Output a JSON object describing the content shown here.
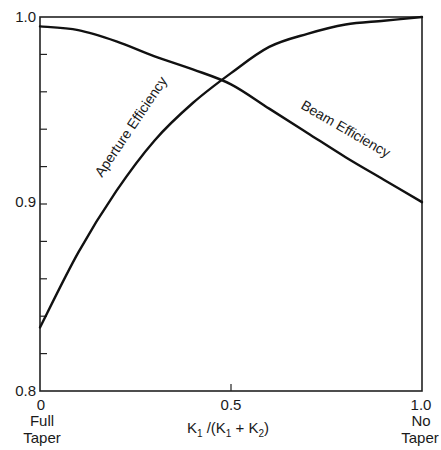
{
  "chart_data": {
    "type": "line",
    "title": "",
    "xlabel": "K1 /(K1 + K2)",
    "ylabel": "",
    "xlim": [
      0,
      1.0
    ],
    "ylim": [
      0.8,
      1.0
    ],
    "grid": false,
    "legend": "inline curve labels",
    "x_ticks": [
      {
        "value": 0,
        "label": "0",
        "sublabel": [
          "Full",
          "Taper"
        ]
      },
      {
        "value": 0.5,
        "label": "0.5",
        "sublabel": []
      },
      {
        "value": 1.0,
        "label": "1.0",
        "sublabel": [
          "No",
          "Taper"
        ]
      }
    ],
    "y_ticks_labeled": [
      {
        "value": 1.0,
        "label": "1.0"
      },
      {
        "value": 0.9,
        "label": "0.9"
      },
      {
        "value": 0.8,
        "label": "0.8"
      }
    ],
    "y_minor_tick_step": 0.02,
    "x": [
      0.0,
      0.1,
      0.2,
      0.3,
      0.4,
      0.5,
      0.6,
      0.7,
      0.8,
      0.9,
      1.0
    ],
    "series": [
      {
        "name": "Aperture Efficiency",
        "values": [
          0.834,
          0.874,
          0.907,
          0.934,
          0.954,
          0.97,
          0.984,
          0.991,
          0.996,
          0.998,
          1.0
        ]
      },
      {
        "name": "Beam Efficiency",
        "values": [
          0.995,
          0.993,
          0.987,
          0.979,
          0.972,
          0.964,
          0.951,
          0.938,
          0.925,
          0.913,
          0.901
        ]
      }
    ],
    "annotations": [
      {
        "text": "Aperture Efficiency",
        "along_series": "Aperture Efficiency"
      },
      {
        "text": "Beam Efficiency",
        "along_series": "Beam Efficiency"
      }
    ]
  },
  "labels": {
    "y_1_0": "1.0",
    "y_0_9": "0.9",
    "y_0_8": "0.8",
    "x_0": "0",
    "x_0_5": "0.5",
    "x_1_0": "1.0",
    "x_0_sub1": "Full",
    "x_0_sub2": "Taper",
    "x_1_sub1": "No",
    "x_1_sub2": "Taper",
    "x_axis_K1": "K",
    "x_axis_rest1": " /(K",
    "x_axis_rest2": " + K",
    "x_axis_close": ")",
    "sub1": "1",
    "sub2": "2",
    "aperture_label": "Aperture Efficiency",
    "beam_label": "Beam Efficiency"
  }
}
